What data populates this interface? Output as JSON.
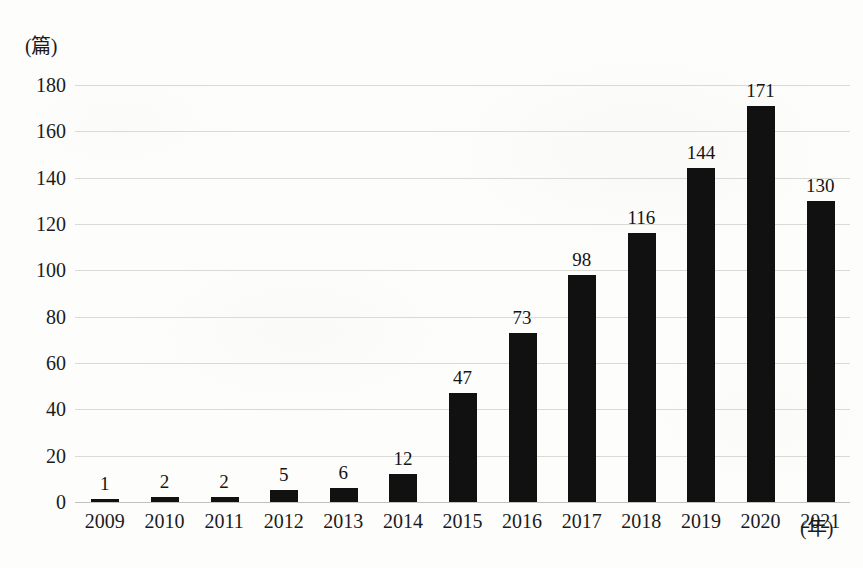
{
  "chart_data": {
    "type": "bar",
    "title": "",
    "subtitle": "",
    "xlabel": "(年)",
    "ylabel": "(篇)",
    "categories": [
      "2009",
      "2010",
      "2011",
      "2012",
      "2013",
      "2014",
      "2015",
      "2016",
      "2017",
      "2018",
      "2019",
      "2020",
      "2021"
    ],
    "values": [
      1,
      2,
      2,
      5,
      6,
      12,
      47,
      73,
      98,
      116,
      144,
      171,
      130
    ],
    "value_labels": [
      "1",
      "2",
      "2",
      "5",
      "6",
      "12",
      "47",
      "73",
      "98",
      "116",
      "144",
      "171",
      "130"
    ],
    "ylim": [
      0,
      180
    ],
    "ytick_step": 20,
    "ytick_labels": [
      "180",
      "160",
      "140",
      "120",
      "100",
      "80",
      "60",
      "40",
      "20",
      "0"
    ],
    "ytick_values": [
      180,
      160,
      140,
      120,
      100,
      80,
      60,
      40,
      20,
      0
    ],
    "grid": true,
    "grid_axis": "y",
    "legend": false,
    "legend_position": "none",
    "bar_color": "#111111",
    "grid_color": "#d9d9d6",
    "axis_color": "#c2c2bd",
    "text_color": "#1b1b1b",
    "background_color": "#fdfdfc",
    "data_labels": true
  }
}
